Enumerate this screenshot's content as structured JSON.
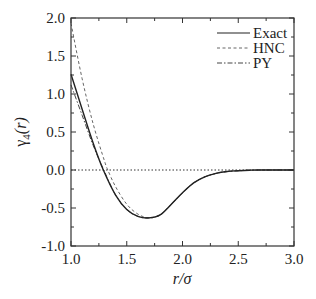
{
  "chart_data": {
    "type": "line",
    "title": "",
    "xlabel": "r/σ",
    "ylabel": "γ4(r)",
    "ylabel_parts": {
      "base": "γ",
      "subscript": "4",
      "arg": "(r)"
    },
    "xlim": [
      1.0,
      3.0
    ],
    "ylim": [
      -1.0,
      2.0
    ],
    "xticks": [
      1.0,
      1.5,
      2.0,
      2.5,
      3.0
    ],
    "xtick_labels": [
      "1.0",
      "1.5",
      "2.0",
      "2.5",
      "3.0"
    ],
    "yticks": [
      -1.0,
      -0.5,
      0.0,
      0.5,
      1.0,
      1.5,
      2.0
    ],
    "ytick_labels": [
      "-1.0",
      "-0.5",
      "0.0",
      "0.5",
      "1.0",
      "1.5",
      "2.0"
    ],
    "grid": false,
    "reference_line": {
      "y": 0.0,
      "style": "dotted"
    },
    "legend_position": "upper right",
    "series": [
      {
        "name": "Exact",
        "style": "solid",
        "x": [
          1.0,
          1.1,
          1.2,
          1.29,
          1.4,
          1.5,
          1.6,
          1.7,
          1.8,
          1.9,
          2.0,
          2.1,
          2.2,
          2.3,
          2.4,
          2.5,
          2.6,
          2.7,
          3.0
        ],
        "y": [
          1.26,
          0.8,
          0.35,
          0.0,
          -0.33,
          -0.52,
          -0.61,
          -0.63,
          -0.59,
          -0.45,
          -0.3,
          -0.17,
          -0.09,
          -0.045,
          -0.02,
          -0.01,
          -0.003,
          0.0,
          0.0
        ]
      },
      {
        "name": "HNC",
        "style": "dashed",
        "x": [
          1.0,
          1.1,
          1.2,
          1.3,
          1.33,
          1.4,
          1.5,
          1.6,
          1.7,
          1.8,
          1.9,
          2.0,
          2.1,
          2.2,
          2.3,
          2.4,
          2.5,
          2.6,
          2.7,
          3.0
        ],
        "y": [
          1.93,
          1.2,
          0.6,
          0.12,
          0.0,
          -0.22,
          -0.45,
          -0.58,
          -0.63,
          -0.59,
          -0.45,
          -0.3,
          -0.17,
          -0.09,
          -0.045,
          -0.02,
          -0.01,
          -0.003,
          0.0,
          0.0
        ]
      },
      {
        "name": "PY",
        "style": "dash-dot",
        "x": [
          1.0,
          1.1,
          1.2,
          1.3,
          1.4,
          1.5,
          1.6,
          1.7,
          1.8,
          1.9,
          2.0,
          2.1,
          2.2,
          2.3,
          2.4,
          2.5,
          2.6,
          2.7,
          3.0
        ],
        "y": [
          1.12,
          0.72,
          0.32,
          -0.02,
          -0.33,
          -0.52,
          -0.61,
          -0.63,
          -0.59,
          -0.45,
          -0.3,
          -0.17,
          -0.09,
          -0.045,
          -0.02,
          -0.01,
          -0.003,
          0.0,
          0.0
        ]
      }
    ]
  },
  "legend": {
    "items": [
      {
        "label": "Exact",
        "style": "solid"
      },
      {
        "label": "HNC",
        "style": "dashed"
      },
      {
        "label": "PY",
        "style": "dash-dot"
      }
    ]
  },
  "colors": {
    "axis": "#333333",
    "exact": "#222222",
    "hnc": "#666666",
    "py": "#444444",
    "zero_line": "#333333"
  }
}
